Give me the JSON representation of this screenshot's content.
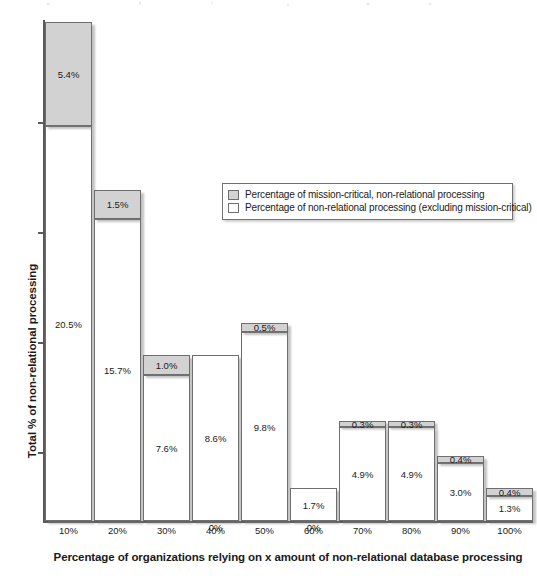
{
  "chart_data": {
    "type": "bar",
    "subtype": "stacked-column",
    "title": "",
    "xlabel": "Percentage of organizations relying on x amount of non-relational database processing",
    "ylabel": "Total % of non-relational processing",
    "categories": [
      "10%",
      "20%",
      "30%",
      "40%",
      "50%",
      "60%",
      "70%",
      "80%",
      "90%",
      "100%"
    ],
    "ylim": [
      0,
      25.9
    ],
    "grid": false,
    "legend_position": "upper-center-right",
    "series": [
      {
        "name": "Percentage of non-relational processing (excluding mission-critical)",
        "color": "#ffffff",
        "values": [
          20.5,
          15.7,
          7.6,
          8.6,
          9.8,
          1.7,
          4.9,
          4.9,
          3.0,
          1.3
        ],
        "labels": [
          "20.5%",
          "15.7%",
          "7.6%",
          "8.6%",
          "9.8%",
          "1.7%",
          "4.9%",
          "4.9%",
          "3.0%",
          "1.3%"
        ]
      },
      {
        "name": "Percentage of mission-critical, non-relational processing",
        "color": "#d2d2d2",
        "values": [
          5.4,
          1.5,
          1.0,
          0.0,
          0.5,
          0.0,
          0.3,
          0.3,
          0.4,
          0.4
        ],
        "labels": [
          "5.4%",
          "1.5%",
          "1.0%",
          "0%",
          "0.5%",
          "0%",
          "0.3%",
          "0.3%",
          "0.4%",
          "0.4%"
        ]
      }
    ],
    "totals": [
      25.9,
      17.2,
      8.6,
      8.6,
      10.3,
      1.7,
      5.2,
      5.2,
      3.4,
      1.7
    ]
  },
  "axes": {
    "y_title": "Total % of non-relational processing",
    "x_title": "Percentage of organizations relying on x amount of non-relational database processing",
    "x_tick_labels": [
      "10%",
      "20%",
      "30%",
      "40%",
      "50%",
      "60%",
      "70%",
      "80%",
      "90%",
      "100%"
    ]
  },
  "legend": {
    "entries": [
      {
        "swatch": "gray",
        "label": "Percentage of mission-critical, non-relational processing"
      },
      {
        "swatch": "white",
        "label": "Percentage of non-relational processing (excluding mission-critical)"
      }
    ]
  },
  "bar_labels": {
    "gray": [
      "5.4%",
      "1.5%",
      "1.0%",
      "0%",
      "0.5%",
      "0%",
      "0.3%",
      "0.3%",
      "0.4%",
      "0.4%"
    ],
    "white": [
      "20.5%",
      "15.7%",
      "7.6%",
      "8.6%",
      "9.8%",
      "1.7%",
      "4.9%",
      "4.9%",
      "3.0%",
      "1.3%"
    ]
  }
}
